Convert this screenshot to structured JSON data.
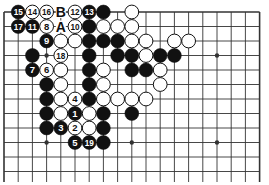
{
  "board": {
    "cols": 19,
    "rows": 12,
    "x0": 4,
    "dx": 14.2,
    "y0": 12,
    "dy": 14.5,
    "line_color": "#333333",
    "black_color": "#111111",
    "white_color": "#ffffff"
  },
  "star_points": [
    [
      3,
      3
    ],
    [
      15,
      3
    ],
    [
      3,
      9
    ],
    [
      9,
      9
    ],
    [
      15,
      9
    ]
  ],
  "stones": [
    {
      "c": 1,
      "r": 0,
      "color": "black",
      "label": "15"
    },
    {
      "c": 2,
      "r": 0,
      "color": "white",
      "label": "14"
    },
    {
      "c": 3,
      "r": 0,
      "color": "white",
      "label": "16"
    },
    {
      "c": 5,
      "r": 0,
      "color": "white",
      "label": "12"
    },
    {
      "c": 6,
      "r": 0,
      "color": "black",
      "label": "13"
    },
    {
      "c": 7,
      "r": 0,
      "color": "black",
      "label": ""
    },
    {
      "c": 9,
      "r": 0,
      "color": "white",
      "label": ""
    },
    {
      "c": 1,
      "r": 1,
      "color": "black",
      "label": "17"
    },
    {
      "c": 2,
      "r": 1,
      "color": "black",
      "label": "11"
    },
    {
      "c": 3,
      "r": 1,
      "color": "white",
      "label": "8"
    },
    {
      "c": 5,
      "r": 1,
      "color": "white",
      "label": "10"
    },
    {
      "c": 6,
      "r": 1,
      "color": "black",
      "label": ""
    },
    {
      "c": 7,
      "r": 1,
      "color": "white",
      "label": ""
    },
    {
      "c": 8,
      "r": 1,
      "color": "white",
      "label": ""
    },
    {
      "c": 9,
      "r": 1,
      "color": "white",
      "label": ""
    },
    {
      "c": 3,
      "r": 2,
      "color": "black",
      "label": "9"
    },
    {
      "c": 4,
      "r": 2,
      "color": "white",
      "label": ""
    },
    {
      "c": 5,
      "r": 2,
      "color": "white",
      "label": ""
    },
    {
      "c": 6,
      "r": 2,
      "color": "black",
      "label": ""
    },
    {
      "c": 7,
      "r": 2,
      "color": "black",
      "label": ""
    },
    {
      "c": 8,
      "r": 2,
      "color": "black",
      "label": ""
    },
    {
      "c": 9,
      "r": 2,
      "color": "white",
      "label": ""
    },
    {
      "c": 10,
      "r": 2,
      "color": "white",
      "label": ""
    },
    {
      "c": 12,
      "r": 2,
      "color": "white",
      "label": ""
    },
    {
      "c": 13,
      "r": 2,
      "color": "white",
      "label": ""
    },
    {
      "c": 2,
      "r": 3,
      "color": "black",
      "label": ""
    },
    {
      "c": 4,
      "r": 3,
      "color": "white",
      "label": "18"
    },
    {
      "c": 6,
      "r": 3,
      "color": "black",
      "label": ""
    },
    {
      "c": 8,
      "r": 3,
      "color": "black",
      "label": ""
    },
    {
      "c": 9,
      "r": 3,
      "color": "black",
      "label": ""
    },
    {
      "c": 10,
      "r": 3,
      "color": "white",
      "label": ""
    },
    {
      "c": 11,
      "r": 3,
      "color": "black",
      "label": ""
    },
    {
      "c": 12,
      "r": 3,
      "color": "black",
      "label": ""
    },
    {
      "c": 2,
      "r": 4,
      "color": "black",
      "label": "7"
    },
    {
      "c": 3,
      "r": 4,
      "color": "white",
      "label": "6"
    },
    {
      "c": 4,
      "r": 4,
      "color": "white",
      "label": ""
    },
    {
      "c": 6,
      "r": 4,
      "color": "black",
      "label": ""
    },
    {
      "c": 7,
      "r": 4,
      "color": "white",
      "label": ""
    },
    {
      "c": 9,
      "r": 4,
      "color": "black",
      "label": ""
    },
    {
      "c": 10,
      "r": 4,
      "color": "black",
      "label": ""
    },
    {
      "c": 11,
      "r": 4,
      "color": "white",
      "label": ""
    },
    {
      "c": 3,
      "r": 5,
      "color": "black",
      "label": ""
    },
    {
      "c": 4,
      "r": 5,
      "color": "white",
      "label": ""
    },
    {
      "c": 6,
      "r": 5,
      "color": "black",
      "label": ""
    },
    {
      "c": 7,
      "r": 5,
      "color": "white",
      "label": ""
    },
    {
      "c": 11,
      "r": 5,
      "color": "white",
      "label": ""
    },
    {
      "c": 3,
      "r": 6,
      "color": "black",
      "label": ""
    },
    {
      "c": 4,
      "r": 6,
      "color": "white",
      "label": ""
    },
    {
      "c": 5,
      "r": 6,
      "color": "white",
      "label": "4"
    },
    {
      "c": 6,
      "r": 6,
      "color": "black",
      "label": ""
    },
    {
      "c": 7,
      "r": 6,
      "color": "white",
      "label": ""
    },
    {
      "c": 8,
      "r": 6,
      "color": "white",
      "label": ""
    },
    {
      "c": 9,
      "r": 6,
      "color": "white",
      "label": ""
    },
    {
      "c": 10,
      "r": 6,
      "color": "white",
      "label": ""
    },
    {
      "c": 3,
      "r": 7,
      "color": "black",
      "label": ""
    },
    {
      "c": 4,
      "r": 7,
      "color": "white",
      "label": ""
    },
    {
      "c": 5,
      "r": 7,
      "color": "black",
      "label": "1"
    },
    {
      "c": 6,
      "r": 7,
      "color": "white",
      "label": ""
    },
    {
      "c": 7,
      "r": 7,
      "color": "black",
      "label": ""
    },
    {
      "c": 9,
      "r": 7,
      "color": "black",
      "label": ""
    },
    {
      "c": 3,
      "r": 8,
      "color": "black",
      "label": ""
    },
    {
      "c": 4,
      "r": 8,
      "color": "black",
      "label": "3"
    },
    {
      "c": 5,
      "r": 8,
      "color": "white",
      "label": "2"
    },
    {
      "c": 6,
      "r": 8,
      "color": "white",
      "label": ""
    },
    {
      "c": 7,
      "r": 8,
      "color": "black",
      "label": ""
    },
    {
      "c": 5,
      "r": 9,
      "color": "black",
      "label": "5"
    },
    {
      "c": 6,
      "r": 9,
      "color": "black",
      "label": "19"
    },
    {
      "c": 7,
      "r": 9,
      "color": "black",
      "label": ""
    }
  ],
  "markers": [
    {
      "c": 4,
      "r": 0,
      "label": "B"
    },
    {
      "c": 4,
      "r": 1,
      "label": "A"
    }
  ]
}
